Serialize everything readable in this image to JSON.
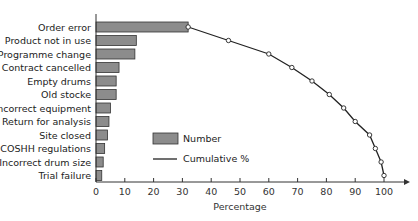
{
  "chart_data": {
    "type": "bar",
    "orientation": "horizontal",
    "title": "",
    "xlabel": "Percentage",
    "ylabel": "",
    "xlim": [
      0,
      105
    ],
    "xticks": [
      0,
      10,
      20,
      30,
      40,
      50,
      60,
      70,
      80,
      90,
      100
    ],
    "grid": false,
    "legend_position": "center",
    "categories": [
      "Order error",
      "Product not in use",
      "Programme change",
      "Contract cancelled",
      "Empty drums",
      "Old stocke",
      "Incorrect equipment",
      "Return for analysis",
      "Site closed",
      "COSHH regulations",
      "Incorrect drum size",
      "Trial failure"
    ],
    "series": [
      {
        "name": "Number",
        "type": "bar",
        "values": [
          32,
          14,
          13.5,
          8,
          7,
          7,
          5,
          4.5,
          4,
          3,
          2.5,
          2
        ]
      },
      {
        "name": "Cumulative %",
        "type": "line",
        "values": [
          32,
          46,
          60,
          68,
          75,
          81,
          86,
          90,
          95,
          97,
          99,
          100
        ]
      }
    ],
    "colors": {
      "bar_fill": "#8c8c8c",
      "bar_stroke": "#333333",
      "line": "#222222",
      "marker_fill": "#ffffff"
    }
  },
  "legend": {
    "number_label": "Number",
    "cumulative_label": "Cumulative %"
  },
  "axis": {
    "xlabel": "Percentage"
  }
}
